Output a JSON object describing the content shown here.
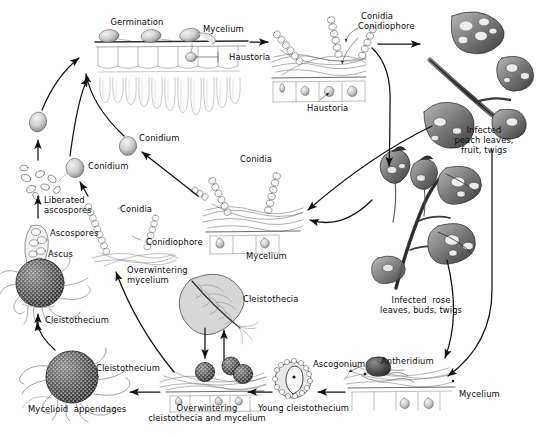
{
  "diagram": {
    "background_color": "#fefefe",
    "ink_color": "#1a1a1a",
    "labels": [
      {
        "name": "germination",
        "text": "Germination",
        "x": 137,
        "y": 18,
        "align": "center"
      },
      {
        "name": "mycelium-top",
        "text": "Mycelium",
        "x": 203,
        "y": 25,
        "align": "left"
      },
      {
        "name": "haustoria-top",
        "text": "Haustoria",
        "x": 229,
        "y": 53,
        "align": "left"
      },
      {
        "name": "conidia-top",
        "text": "Conidia",
        "x": 361,
        "y": 12,
        "align": "left"
      },
      {
        "name": "conidiophore-top",
        "text": "Conidiophore",
        "x": 361,
        "y": 22,
        "align": "left"
      },
      {
        "name": "haustoria-mid",
        "text": "Haustoria",
        "x": 318,
        "y": 104,
        "align": "left"
      },
      {
        "name": "infected-peach",
        "text": "Infected\npeach leaves,\nfruit, twigs",
        "x": 484,
        "y": 128,
        "align": "center"
      },
      {
        "name": "conidium-upper",
        "text": "Conidium",
        "x": 139,
        "y": 134,
        "align": "left"
      },
      {
        "name": "conidium-lower",
        "text": "Conidium",
        "x": 88,
        "y": 162,
        "align": "left"
      },
      {
        "name": "conidia-center",
        "text": "Conidia",
        "x": 240,
        "y": 155,
        "align": "left"
      },
      {
        "name": "mycelium-center",
        "text": "Mycelium",
        "x": 246,
        "y": 252,
        "align": "left"
      },
      {
        "name": "liberated-ascospores",
        "text": "Liberated\nascospores",
        "x": 37,
        "y": 195,
        "align": "left"
      },
      {
        "name": "conidia-left",
        "text": "Conidia",
        "x": 120,
        "y": 205,
        "align": "left"
      },
      {
        "name": "conidiophore-left",
        "text": "Conidiophore",
        "x": 143,
        "y": 238,
        "align": "left"
      },
      {
        "name": "ascospores",
        "text": "Ascospores",
        "x": 47,
        "y": 230,
        "align": "left"
      },
      {
        "name": "ascus",
        "text": "Ascus",
        "x": 44,
        "y": 249,
        "align": "left"
      },
      {
        "name": "overwintering-mycelium",
        "text": "Overwintering\nmycelium",
        "x": 126,
        "y": 268,
        "align": "left"
      },
      {
        "name": "cleistothecia-leaf",
        "text": "Cleistothecia",
        "x": 243,
        "y": 295,
        "align": "left"
      },
      {
        "name": "cleistothecium-upper",
        "text": "Cleistothecium",
        "x": 47,
        "y": 315,
        "align": "left"
      },
      {
        "name": "cleistothecium-lower",
        "text": "Cleistothecium",
        "x": 93,
        "y": 363,
        "align": "left"
      },
      {
        "name": "mycelioid-appendages",
        "text": "Mycelioid  appendages",
        "x": 30,
        "y": 404,
        "align": "left"
      },
      {
        "name": "overwintering-cleistothecia",
        "text": "Overwintering\ncleistothecia and mycelium",
        "x": 207,
        "y": 403,
        "align": "center"
      },
      {
        "name": "young-cleistothecium",
        "text": "Young cleistothecium",
        "x": 262,
        "y": 403,
        "align": "left"
      },
      {
        "name": "infected-rose",
        "text": "Infected  rose\nleaves, buds, twigs",
        "x": 421,
        "y": 297,
        "align": "center"
      },
      {
        "name": "ascogonium",
        "text": "Ascogonium",
        "x": 318,
        "y": 360,
        "align": "left"
      },
      {
        "name": "antheridium",
        "text": "Antheridium",
        "x": 381,
        "y": 358,
        "align": "left"
      },
      {
        "name": "mycelium-bottom",
        "text": "Mycelium",
        "x": 459,
        "y": 390,
        "align": "left"
      }
    ]
  }
}
